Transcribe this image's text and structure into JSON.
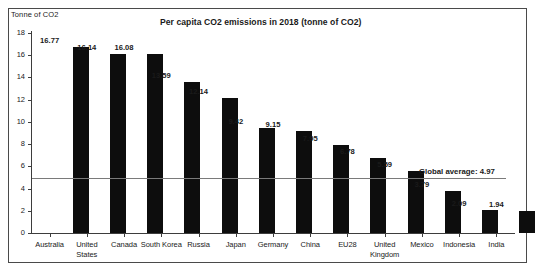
{
  "chart_data": {
    "type": "bar",
    "title": "Per capita CO2 emissions in 2018 (tonne of CO2)",
    "xlabel": "",
    "ylabel": "Tonne of CO2",
    "categories": [
      "Australia",
      "United States",
      "Canada",
      "South Korea",
      "Russia",
      "Japan",
      "Germany",
      "China",
      "EU28",
      "United Kingdom",
      "Mexico",
      "Indonesia",
      "India"
    ],
    "values": [
      16.77,
      16.14,
      16.08,
      13.59,
      12.14,
      9.42,
      9.15,
      7.95,
      6.78,
      5.59,
      3.79,
      2.09,
      1.94
    ],
    "value_labels": [
      "16.77",
      "16.14",
      "16.08",
      "13.59",
      "12.14",
      "9.42",
      "9.15",
      "7.95",
      "6.78",
      "5.59",
      "3.79",
      "2.09",
      "1.94"
    ],
    "ylim": [
      0,
      18
    ],
    "ytick_labels": [
      "18",
      "16",
      "14",
      "12",
      "10",
      "8",
      "6",
      "4",
      "2",
      "0"
    ],
    "ytick_values": [
      18,
      16,
      14,
      12,
      10,
      8,
      6,
      4,
      2,
      0
    ],
    "grid": false,
    "legend": false,
    "bar_color": "#0d0d0d",
    "annotations": [
      {
        "name": "global-average",
        "text": "Global average: 4.97",
        "value": 4.97,
        "type": "horizontal-reference-line",
        "line_color": "#7a7a7a"
      }
    ]
  }
}
